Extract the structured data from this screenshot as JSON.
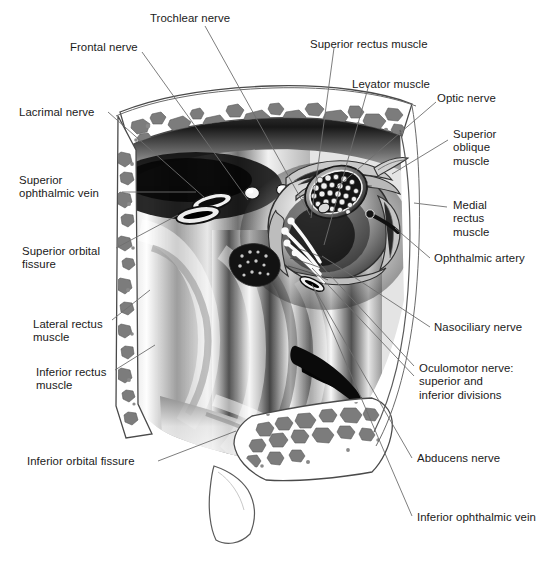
{
  "figure": {
    "style": "grayscale medical illustration, pen and airbrush",
    "background_color": "#ffffff",
    "text_color": "#1a1a1a",
    "leader_line_color": "#6e6e6e",
    "bone_marrow_color": "#7d7d7d",
    "bone_outline_color": "#555555"
  },
  "labels": [
    {
      "id": "trochlear-nerve",
      "text": "Trochlear nerve",
      "lines": [
        "Trochlear nerve"
      ],
      "x": 150,
      "y": 12,
      "align": "left"
    },
    {
      "id": "frontal-nerve",
      "text": "Frontal nerve",
      "lines": [
        "Frontal nerve"
      ],
      "x": 70,
      "y": 41,
      "align": "left"
    },
    {
      "id": "lacrimal-nerve",
      "text": "Lacrimal nerve",
      "lines": [
        "Lacrimal nerve"
      ],
      "x": 19,
      "y": 106,
      "align": "left"
    },
    {
      "id": "superior-ophthalmic-vein",
      "text": "Superior ophthalmic vein",
      "lines": [
        "Superior",
        "ophthalmic vein"
      ],
      "x": 19,
      "y": 174,
      "align": "left"
    },
    {
      "id": "superior-orbital-fissure",
      "text": "Superior orbital fissure",
      "lines": [
        "Superior orbital",
        "fissure"
      ],
      "x": 22,
      "y": 245,
      "align": "left"
    },
    {
      "id": "lateral-rectus-muscle",
      "text": "Lateral rectus muscle",
      "lines": [
        "Lateral rectus",
        "muscle"
      ],
      "x": 33,
      "y": 318,
      "align": "left"
    },
    {
      "id": "inferior-rectus-muscle",
      "text": "Inferior rectus muscle",
      "lines": [
        "Inferior rectus",
        "muscle"
      ],
      "x": 36,
      "y": 366,
      "align": "left"
    },
    {
      "id": "inferior-orbital-fissure",
      "text": "Inferior orbital fissure",
      "lines": [
        "Inferior orbital fissure"
      ],
      "x": 27,
      "y": 455,
      "align": "left"
    },
    {
      "id": "superior-rectus-muscle",
      "text": "Superior rectus muscle",
      "lines": [
        "Superior rectus muscle"
      ],
      "x": 310,
      "y": 38,
      "align": "left"
    },
    {
      "id": "levator-muscle",
      "text": "Levator muscle",
      "lines": [
        "Levator muscle"
      ],
      "x": 352,
      "y": 78,
      "align": "left"
    },
    {
      "id": "optic-nerve",
      "text": "Optic nerve",
      "lines": [
        "Optic nerve"
      ],
      "x": 437,
      "y": 92,
      "align": "left"
    },
    {
      "id": "superior-oblique-muscle",
      "text": "Superior oblique muscle",
      "lines": [
        "Superior",
        "oblique",
        "muscle"
      ],
      "x": 453,
      "y": 128,
      "align": "left"
    },
    {
      "id": "medial-rectus-muscle",
      "text": "Medial rectus muscle",
      "lines": [
        "Medial",
        "rectus",
        "muscle"
      ],
      "x": 453,
      "y": 199,
      "align": "left"
    },
    {
      "id": "ophthalmic-artery",
      "text": "Ophthalmic artery",
      "lines": [
        "Ophthalmic artery"
      ],
      "x": 434,
      "y": 252,
      "align": "left"
    },
    {
      "id": "nasociliary-nerve",
      "text": "Nasociliary nerve",
      "lines": [
        "Nasociliary nerve"
      ],
      "x": 434,
      "y": 321,
      "align": "left"
    },
    {
      "id": "oculomotor-nerve",
      "text": "Oculomotor nerve: superior and inferior divisions",
      "lines": [
        "Oculomotor nerve:",
        "superior and",
        "inferior divisions"
      ],
      "x": 419,
      "y": 362,
      "align": "left"
    },
    {
      "id": "abducens-nerve",
      "text": "Abducens nerve",
      "lines": [
        "Abducens nerve"
      ],
      "x": 417,
      "y": 452,
      "align": "left"
    },
    {
      "id": "inferior-ophthalmic-vein",
      "text": "Inferior ophthalmic vein",
      "lines": [
        "Inferior ophthalmic vein"
      ],
      "x": 417,
      "y": 511,
      "align": "left"
    }
  ],
  "leaders": [
    {
      "id": "leader-trochlear-nerve",
      "from": [
        205,
        26
      ],
      "to": [
        310,
        215
      ]
    },
    {
      "id": "leader-frontal-nerve",
      "from": [
        142,
        52
      ],
      "to": [
        248,
        200
      ]
    },
    {
      "id": "leader-lacrimal-nerve",
      "from": [
        108,
        112
      ],
      "to": [
        205,
        198
      ]
    },
    {
      "id": "leader-superior-ophthalmic-vein",
      "from": [
        122,
        192
      ],
      "to": [
        196,
        192
      ]
    },
    {
      "id": "leader-superior-orbital-fissure",
      "from": [
        116,
        248
      ],
      "to": [
        178,
        215
      ]
    },
    {
      "id": "leader-lateral-rectus-muscle",
      "from": [
        112,
        320
      ],
      "to": [
        150,
        290
      ]
    },
    {
      "id": "leader-inferior-rectus-muscle",
      "from": [
        115,
        370
      ],
      "to": [
        155,
        345
      ]
    },
    {
      "id": "leader-inferior-orbital-fissure",
      "from": [
        158,
        461
      ],
      "to": [
        236,
        431
      ]
    },
    {
      "id": "leader-superior-rectus-muscle",
      "from": [
        334,
        48
      ],
      "to": [
        311,
        218
      ]
    },
    {
      "id": "leader-levator-muscle",
      "from": [
        368,
        88
      ],
      "to": [
        324,
        245
      ]
    },
    {
      "id": "leader-optic-nerve",
      "from": [
        436,
        102
      ],
      "to": [
        336,
        188
      ]
    },
    {
      "id": "leader-superior-oblique-muscle",
      "from": [
        448,
        140
      ],
      "to": [
        392,
        174
      ]
    },
    {
      "id": "leader-medial-rectus-muscle",
      "from": [
        447,
        207
      ],
      "to": [
        414,
        203
      ]
    },
    {
      "id": "leader-ophthalmic-artery",
      "from": [
        430,
        258
      ],
      "to": [
        395,
        228
      ]
    },
    {
      "id": "leader-nasociliary-nerve",
      "from": [
        430,
        327
      ],
      "to": [
        322,
        256
      ]
    },
    {
      "id": "leader-oculomotor-nerve-sup",
      "from": [
        414,
        366
      ],
      "to": [
        318,
        262
      ]
    },
    {
      "id": "leader-oculomotor-nerve-inf",
      "from": [
        414,
        376
      ],
      "to": [
        312,
        268
      ]
    },
    {
      "id": "leader-abducens-nerve",
      "from": [
        412,
        458
      ],
      "to": [
        315,
        290
      ]
    },
    {
      "id": "leader-inferior-ophthalmic-vein",
      "from": [
        412,
        516
      ],
      "to": [
        312,
        284
      ]
    }
  ]
}
